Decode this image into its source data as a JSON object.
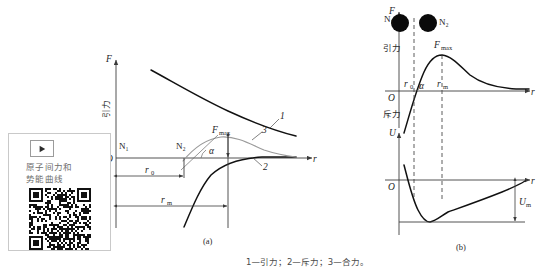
{
  "promo": {
    "play_icon": "play-triangle-icon",
    "title_line1": "原子间力和",
    "title_line2": "势能曲线",
    "qr_label": "qr-code"
  },
  "panel_a": {
    "id": "(a)",
    "y_axis_symbol": "F",
    "x_axis_symbol": "r",
    "origin_label": "O",
    "upper_region_label": "引力",
    "lower_region_label": "斥力",
    "atom_labels": [
      "N₁",
      "N₂"
    ],
    "fmax_label": "F",
    "fmax_sub": "max",
    "angle_label": "α",
    "r0_label": "r",
    "r0_sub": "0",
    "rm_label": "r",
    "rm_sub": "m",
    "curve_numbers": [
      "1",
      "2",
      "3"
    ]
  },
  "panel_b": {
    "id": "(b)",
    "force_y_symbol": "F",
    "force_x_symbol": "r",
    "energy_y_symbol": "U",
    "energy_x_symbol": "r",
    "origin_label": "O",
    "upper_region_label": "引力",
    "lower_region_label": "斥力",
    "atom_labels": [
      "N₁",
      "N₂"
    ],
    "fmax_label": "F",
    "fmax_sub": "max",
    "angle_label": "α",
    "r0_label": "r",
    "r0_sub": "0",
    "rm_label": "r",
    "rm_sub": "m",
    "um_label": "U",
    "um_sub": "m"
  },
  "caption": {
    "text": "1—引力；2—斥力；3—合力。"
  },
  "chart_data": {
    "type": "line",
    "title": "",
    "charts": [
      {
        "name": "panel-a-force-curves",
        "xlabel": "r",
        "ylabel": "F",
        "axis_origin_px": [
          116,
          158
        ],
        "series": [
          {
            "name": "1",
            "meaning": "引力",
            "style": "dark-thick",
            "points": [
              [
                151,
                70
              ],
              [
                170,
                79
              ],
              [
                190,
                90
              ],
              [
                210,
                101
              ],
              [
                232,
                112
              ],
              [
                255,
                122
              ],
              [
                278,
                130
              ],
              [
                296,
                136
              ]
            ]
          },
          {
            "name": "2",
            "meaning": "斥力",
            "style": "dark-thick",
            "points": [
              [
                185,
                225
              ],
              [
                193,
                212
              ],
              [
                201,
                196
              ],
              [
                209,
                182
              ],
              [
                218,
                171
              ],
              [
                228,
                164
              ],
              [
                240,
                160
              ],
              [
                255,
                158
              ],
              [
                272,
                157
              ],
              [
                292,
                157
              ]
            ]
          },
          {
            "name": "3",
            "meaning": "合力",
            "style": "grey-thin",
            "points": [
              [
                184,
                160
              ],
              [
                192,
                152
              ],
              [
                200,
                145
              ],
              [
                209,
                140
              ],
              [
                220,
                137
              ],
              [
                231,
                138
              ],
              [
                242,
                142
              ],
              [
                254,
                147
              ],
              [
                266,
                151
              ],
              [
                279,
                154
              ],
              [
                292,
                156
              ]
            ]
          }
        ],
        "annotations": [
          {
            "name": "F_max",
            "x": 228,
            "y": 130
          },
          {
            "name": "alpha",
            "x": 214,
            "y": 150
          },
          {
            "name": "r0",
            "x": 148,
            "y": 170
          },
          {
            "name": "rm",
            "x": 158,
            "y": 197
          },
          {
            "name": "N1",
            "x": 121,
            "y": 147
          },
          {
            "name": "N2",
            "x": 178,
            "y": 147
          }
        ]
      },
      {
        "name": "panel-b-force-curve",
        "xlabel": "r",
        "ylabel": "F",
        "axis_origin_px": [
          399,
          91
        ],
        "series": [
          {
            "name": "resultant-force",
            "style": "dark",
            "points": [
              [
                405,
                130
              ],
              [
                412,
                112
              ],
              [
                419,
                95
              ],
              [
                425,
                80
              ],
              [
                430,
                68
              ],
              [
                436,
                61
              ],
              [
                443,
                58
              ],
              [
                452,
                62
              ],
              [
                462,
                70
              ],
              [
                474,
                78
              ],
              [
                487,
                83
              ],
              [
                502,
                86
              ],
              [
                518,
                87
              ],
              [
                530,
                88
              ]
            ]
          }
        ],
        "annotations": [
          {
            "name": "F_max",
            "x": 440,
            "y": 46
          },
          {
            "name": "alpha",
            "x": 424,
            "y": 85
          },
          {
            "name": "r0",
            "x": 410,
            "y": 83
          },
          {
            "name": "rm",
            "x": 443,
            "y": 83
          },
          {
            "name": "N1",
            "x": 396,
            "y": 20
          },
          {
            "name": "N2",
            "x": 424,
            "y": 20
          }
        ]
      },
      {
        "name": "panel-b-energy-curve",
        "xlabel": "r",
        "ylabel": "U",
        "axis_origin_px": [
          399,
          192
        ],
        "series": [
          {
            "name": "potential-energy",
            "style": "dark",
            "points": [
              [
                404,
                168
              ],
              [
                408,
                177
              ],
              [
                412,
                188
              ],
              [
                416,
                199
              ],
              [
                420,
                209
              ],
              [
                424,
                216
              ],
              [
                429,
                219
              ],
              [
                435,
                217
              ],
              [
                442,
                212
              ],
              [
                451,
                208
              ],
              [
                464,
                204
              ],
              [
                480,
                200
              ],
              [
                496,
                196
              ],
              [
                512,
                192
              ],
              [
                524,
                188
              ]
            ]
          }
        ],
        "annotations": [
          {
            "name": "U_m",
            "x": 530,
            "y": 207
          }
        ]
      }
    ],
    "grid": false,
    "legend": "below"
  }
}
